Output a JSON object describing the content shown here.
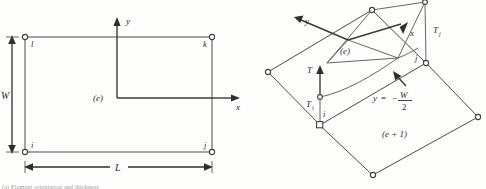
{
  "figure": {
    "caption_fragment": "(a) Element orientation and thickness"
  },
  "panel_left": {
    "name": "plan-view-element",
    "element_label": "(e)",
    "nodes": [
      {
        "id": "i",
        "label": "i",
        "x": 25,
        "y": 152
      },
      {
        "id": "j",
        "label": "j",
        "x": 212,
        "y": 152
      },
      {
        "id": "k",
        "label": "k",
        "x": 212,
        "y": 37
      },
      {
        "id": "l",
        "label": "l",
        "x": 25,
        "y": 37
      }
    ],
    "axes": {
      "x_label": "x",
      "y_label": "y",
      "origin_x": 117,
      "origin_y": 98
    },
    "dimensions": [
      {
        "name": "width",
        "label": "W",
        "orientation": "vertical"
      },
      {
        "name": "length",
        "label": "L",
        "orientation": "horizontal"
      }
    ]
  },
  "panel_right": {
    "name": "perspective-view-elements",
    "element_label": "(e)",
    "adjacent_element_label": "(e + 1)",
    "nodes": [
      {
        "id": "i",
        "label": "i",
        "x": 320,
        "y": 125
      },
      {
        "id": "j",
        "label": "j",
        "x": 426,
        "y": 63
      }
    ],
    "axes": {
      "x_label": "x",
      "y_label": "y"
    },
    "thickness_labels": [
      {
        "name": "thickness-resultant",
        "label": "T",
        "sub": ""
      },
      {
        "name": "thickness-at-i",
        "label": "T",
        "sub": "i"
      },
      {
        "name": "thickness-at-j",
        "label": "T",
        "sub": "j"
      }
    ],
    "equation": {
      "name": "y-equals-minus-w-over-2",
      "lhs": "y",
      "equals": "=",
      "minus": "−",
      "numerator": "W",
      "denominator": "2"
    }
  },
  "colors": {
    "line": "#4a4a4a",
    "axis": "#3a3a3a",
    "text": "#2b2b2b",
    "background": "#fdfdfc",
    "node_fill": "#ffffff"
  }
}
